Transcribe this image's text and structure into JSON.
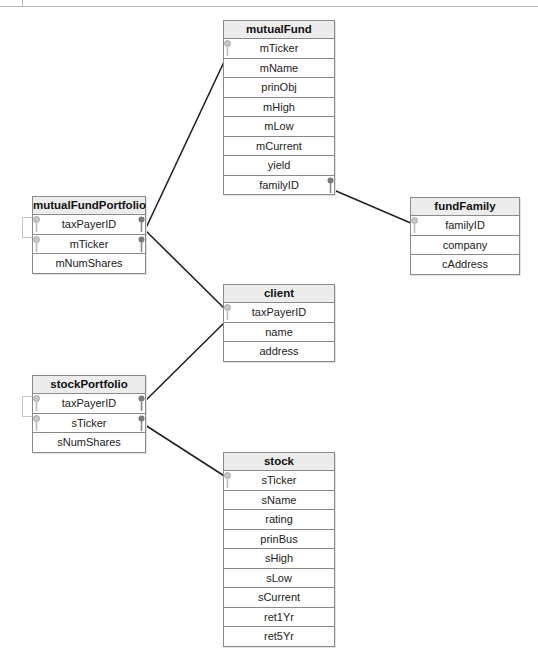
{
  "top_strip": {
    "clipped_text": ""
  },
  "tables": {
    "mutualFund": {
      "name": "mutualFund",
      "columns": [
        "mTicker",
        "mName",
        "prinObj",
        "mHigh",
        "mLow",
        "mCurrent",
        "yield",
        "familyID"
      ]
    },
    "mutualFundPortfolio": {
      "name": "mutualFundPortfolio",
      "columns": [
        "taxPayerID",
        "mTicker",
        "mNumShares"
      ]
    },
    "fundFamily": {
      "name": "fundFamily",
      "columns": [
        "familyID",
        "company",
        "cAddress"
      ]
    },
    "client": {
      "name": "client",
      "columns": [
        "taxPayerID",
        "name",
        "address"
      ]
    },
    "stockPortfolio": {
      "name": "stockPortfolio",
      "columns": [
        "taxPayerID",
        "sTicker",
        "sNumShares"
      ]
    },
    "stock": {
      "name": "stock",
      "columns": [
        "sTicker",
        "sName",
        "rating",
        "prinBus",
        "sHigh",
        "sLow",
        "sCurrent",
        "ret1Yr",
        "ret5Yr"
      ]
    }
  },
  "relationships": [
    {
      "from": "mutualFundPortfolio.mTicker",
      "to": "mutualFund.mTicker"
    },
    {
      "from": "mutualFundPortfolio.taxPayerID",
      "to": "client.taxPayerID"
    },
    {
      "from": "mutualFund.familyID",
      "to": "fundFamily.familyID"
    },
    {
      "from": "stockPortfolio.taxPayerID",
      "to": "client.taxPayerID"
    },
    {
      "from": "stockPortfolio.sTicker",
      "to": "stock.sTicker"
    }
  ],
  "icons": {
    "primary_key": "key-icon",
    "foreign_key": "foreign-key-icon"
  },
  "colors": {
    "border": "#8a8a8a",
    "header_bg": "#ececec",
    "link": "#222222",
    "key_light": "#c8c8c8",
    "key_dark": "#7a7a7a"
  }
}
